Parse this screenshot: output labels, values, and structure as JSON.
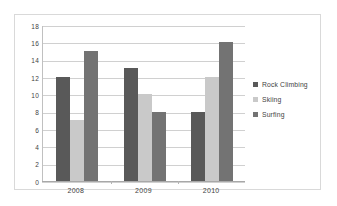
{
  "chart_data": {
    "type": "bar",
    "title": "",
    "xlabel": "",
    "ylabel": "",
    "categories": [
      "2008",
      "2009",
      "2010"
    ],
    "series": [
      {
        "name": "Rock Climbing",
        "color": "#595959",
        "values": [
          12,
          13,
          8
        ]
      },
      {
        "name": "Skiing",
        "color": "#c9c9c9",
        "values": [
          7,
          10,
          12
        ]
      },
      {
        "name": "Surfing",
        "color": "#737373",
        "values": [
          15,
          8,
          16
        ]
      }
    ],
    "ylim": [
      0,
      18
    ],
    "ytick_labels": [
      "18",
      "16",
      "14",
      "12",
      "10",
      "8",
      "6",
      "4",
      "2",
      "0"
    ],
    "ytick_values": [
      18,
      16,
      14,
      12,
      10,
      8,
      6,
      4,
      2,
      0
    ],
    "grid": true,
    "legend_position": "right",
    "bar_grouping": "clustered"
  },
  "frame": {
    "border_color": "#d9d9d9",
    "background": "#ffffff"
  }
}
